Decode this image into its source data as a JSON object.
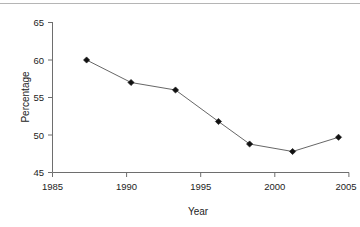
{
  "figure": {
    "background_color": "#ffffff",
    "top_rule_color": "#b5b5b5"
  },
  "chart_data": {
    "type": "line",
    "title": "",
    "subtitle": "",
    "xlabel": "Year",
    "ylabel": "Percentage",
    "xlim": [
      1985,
      2005
    ],
    "ylim": [
      45,
      65
    ],
    "xticks": [
      1985,
      1990,
      1995,
      2000,
      2005
    ],
    "xtick_labels": [
      "1985",
      "1990",
      "1995",
      "2000",
      "2005"
    ],
    "yticks": [
      45,
      50,
      55,
      60,
      65
    ],
    "ytick_labels": [
      "45",
      "50",
      "55",
      "60",
      "65"
    ],
    "grid": false,
    "legend": false,
    "legend_position": "none",
    "marker_style": "filled-diamond",
    "marker_color": "#111111",
    "line_color": "#555555",
    "x": [
      1987.3,
      1990.3,
      1993.3,
      1996.2,
      1998.3,
      2001.2,
      2004.3
    ],
    "values": [
      60.0,
      57.0,
      56.0,
      51.8,
      48.8,
      47.8,
      49.7
    ],
    "series": [
      {
        "name": "Percentage",
        "points": [
          {
            "x": 1987.3,
            "y": 60.0
          },
          {
            "x": 1990.3,
            "y": 57.0
          },
          {
            "x": 1993.3,
            "y": 56.0
          },
          {
            "x": 1996.2,
            "y": 51.8
          },
          {
            "x": 1998.3,
            "y": 48.8
          },
          {
            "x": 2001.2,
            "y": 47.8
          },
          {
            "x": 2004.3,
            "y": 49.7
          }
        ]
      }
    ],
    "annotations": []
  },
  "axis": {
    "y_title": "Percentage",
    "x_title": "Year"
  }
}
